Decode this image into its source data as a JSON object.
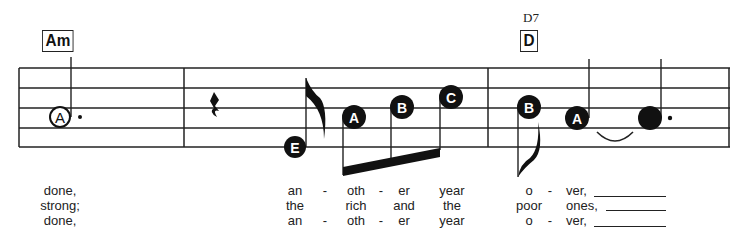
{
  "chords": [
    {
      "name": "Am",
      "alt": ""
    },
    {
      "name": "D",
      "alt": "D7"
    }
  ],
  "notes": [
    {
      "letter": "A",
      "style": "open-circle",
      "duration": "dotted-half",
      "measure": 1
    },
    {
      "letter": "E",
      "style": "filled",
      "duration": "eighth",
      "measure": 2
    },
    {
      "letter": "A",
      "style": "filled",
      "duration": "sixteenth",
      "measure": 2
    },
    {
      "letter": "B",
      "style": "filled",
      "duration": "sixteenth",
      "measure": 2
    },
    {
      "letter": "C",
      "style": "filled",
      "duration": "sixteenth",
      "measure": 2
    },
    {
      "letter": "B",
      "style": "filled",
      "duration": "eighth",
      "measure": 3
    },
    {
      "letter": "A",
      "style": "filled",
      "duration": "quarter",
      "measure": 3
    },
    {
      "letter": "",
      "style": "filled",
      "duration": "dotted-quarter",
      "measure": 3
    }
  ],
  "rest": {
    "type": "quarter-rest"
  },
  "lyrics": {
    "verse1": [
      "done,",
      "an",
      "-",
      "oth",
      "-",
      "er",
      "year",
      "o",
      "-",
      "ver,"
    ],
    "verse2": [
      "strong;",
      "the",
      "rich",
      "and",
      "the",
      "poor",
      "ones,"
    ],
    "verse3": [
      "done,",
      "an",
      "-",
      "oth",
      "-",
      "er",
      "year",
      "o",
      "-",
      "ver,"
    ]
  }
}
